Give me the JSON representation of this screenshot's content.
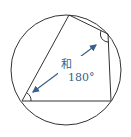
{
  "diagram": {
    "circle": {
      "cx": 66,
      "cy": 70,
      "r": 55,
      "stroke": "#333333"
    },
    "quadrilateral": {
      "vertices": [
        {
          "name": "top",
          "x": 69,
          "y": 15
        },
        {
          "name": "upper-right",
          "x": 108,
          "y": 34
        },
        {
          "name": "lower-right",
          "x": 111,
          "y": 101
        },
        {
          "name": "lower-left",
          "x": 22,
          "y": 101
        }
      ],
      "stroke": "#333333"
    },
    "angle_marks": [
      {
        "vertex": "upper-right"
      },
      {
        "vertex": "lower-left"
      }
    ],
    "arrow": {
      "x1": 30,
      "y1": 94,
      "x2": 100,
      "y2": 43,
      "color": "#3a5f8a"
    },
    "label_line1": "和",
    "label_line2": "180°"
  }
}
